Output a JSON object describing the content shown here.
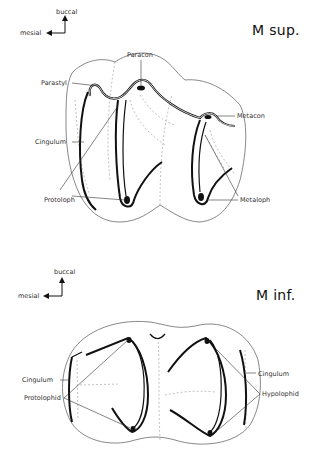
{
  "upper": {
    "title": "M sup.",
    "orientation": {
      "up": "buccal",
      "left": "mesial"
    },
    "labels": {
      "paracon": "Paracon",
      "parastyl": "Parastyl",
      "metacon": "Metacon",
      "cingulum": "Cingulum",
      "protoloph": "Protoloph",
      "metaloph": "Metaloph"
    }
  },
  "lower": {
    "title": "M inf.",
    "orientation": {
      "up": "buccal",
      "left": "mesial"
    },
    "labels": {
      "cingulum_left": "Cingulum",
      "protolophid": "Protolophid",
      "cingulum_right": "Cingulum",
      "hypolophid": "Hypolophid"
    }
  },
  "colors": {
    "ink": "#111111",
    "outline": "#555555",
    "dashed": "#999999",
    "background": "#ffffff"
  }
}
